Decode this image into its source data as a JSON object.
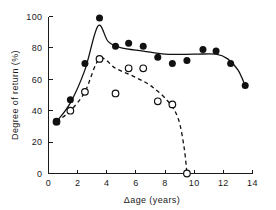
{
  "chart_data": {
    "type": "scatter",
    "title": "",
    "xlabel": "Δage (years)",
    "ylabel": "Degree of return (%)",
    "xlim": [
      0,
      14
    ],
    "ylim": [
      0,
      100
    ],
    "xticks": [
      0,
      2,
      4,
      6,
      8,
      10,
      12,
      14
    ],
    "yticks": [
      0,
      20,
      40,
      60,
      80,
      100
    ],
    "xtick_labels": [
      "0",
      "2",
      "4",
      "6",
      "8",
      "10",
      "12",
      "14"
    ],
    "ytick_labels": [
      "0",
      "20",
      "40",
      "60",
      "80",
      "100"
    ],
    "grid": false,
    "legend": "none",
    "series": [
      {
        "name": "filled-circles",
        "marker": "filled circle",
        "line_style": "solid",
        "points": [
          {
            "x": 0.55,
            "y": 33
          },
          {
            "x": 1.5,
            "y": 47
          },
          {
            "x": 2.5,
            "y": 70
          },
          {
            "x": 3.5,
            "y": 99
          },
          {
            "x": 4.6,
            "y": 81
          },
          {
            "x": 5.5,
            "y": 83
          },
          {
            "x": 6.5,
            "y": 81
          },
          {
            "x": 7.5,
            "y": 74
          },
          {
            "x": 8.5,
            "y": 70
          },
          {
            "x": 9.5,
            "y": 72
          },
          {
            "x": 10.6,
            "y": 79
          },
          {
            "x": 11.5,
            "y": 78
          },
          {
            "x": 12.5,
            "y": 70
          },
          {
            "x": 13.5,
            "y": 56
          }
        ],
        "curve": [
          {
            "x": 0.55,
            "y": 33
          },
          {
            "x": 1.5,
            "y": 45
          },
          {
            "x": 2.5,
            "y": 66
          },
          {
            "x": 3.4,
            "y": 94
          },
          {
            "x": 4.1,
            "y": 84
          },
          {
            "x": 5.0,
            "y": 80
          },
          {
            "x": 6.5,
            "y": 78
          },
          {
            "x": 8.0,
            "y": 76
          },
          {
            "x": 10.0,
            "y": 76
          },
          {
            "x": 11.5,
            "y": 76
          },
          {
            "x": 12.3,
            "y": 73
          },
          {
            "x": 13.0,
            "y": 66
          },
          {
            "x": 13.5,
            "y": 56
          }
        ]
      },
      {
        "name": "open-circles",
        "marker": "open circle",
        "line_style": "dashed",
        "points": [
          {
            "x": 0.55,
            "y": 33
          },
          {
            "x": 1.5,
            "y": 40
          },
          {
            "x": 2.5,
            "y": 52
          },
          {
            "x": 3.5,
            "y": 73
          },
          {
            "x": 4.6,
            "y": 51
          },
          {
            "x": 5.5,
            "y": 67
          },
          {
            "x": 6.5,
            "y": 67
          },
          {
            "x": 7.5,
            "y": 46
          },
          {
            "x": 8.5,
            "y": 44
          },
          {
            "x": 9.5,
            "y": 0
          }
        ],
        "curve": [
          {
            "x": 0.55,
            "y": 33
          },
          {
            "x": 1.5,
            "y": 40
          },
          {
            "x": 2.5,
            "y": 52
          },
          {
            "x": 3.5,
            "y": 73
          },
          {
            "x": 4.6,
            "y": 67
          },
          {
            "x": 5.8,
            "y": 62
          },
          {
            "x": 7.0,
            "y": 56
          },
          {
            "x": 8.2,
            "y": 46
          },
          {
            "x": 8.9,
            "y": 35
          },
          {
            "x": 9.3,
            "y": 17
          },
          {
            "x": 9.5,
            "y": 0
          }
        ]
      }
    ]
  }
}
